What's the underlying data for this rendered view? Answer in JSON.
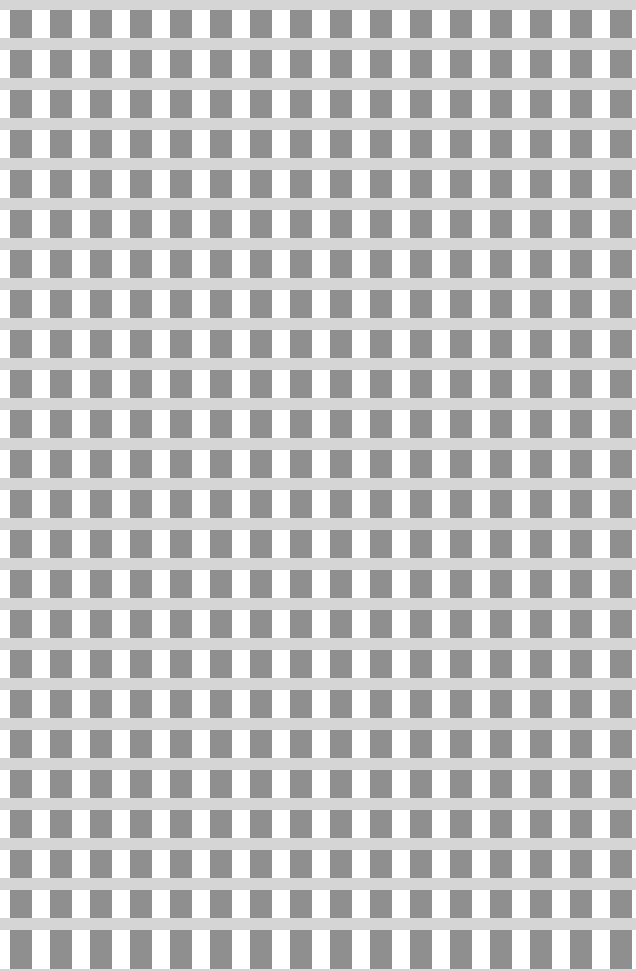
{
  "image": {
    "kind": "gingham-checkered-pattern",
    "width": 636,
    "height": 971,
    "background_color": "#ffffff"
  },
  "pattern": {
    "name": "gingham",
    "description": "Repeating gingham / checkered grid of medium-gray squares on a white field, overlaid by uniform light-gray horizontal bands.",
    "tile_width": 40,
    "tile_height": 40,
    "square_color": "#8f8f8f",
    "band_color": "#d5d5d5",
    "field_color": "#ffffff",
    "square_width": 22,
    "square_height": 28,
    "square_offset_x": 10,
    "band_height": 12,
    "phase_offset_y": -30,
    "band_over_columns": true,
    "columns_visible": 16,
    "rows_visible": 25
  },
  "colors": {
    "square": "#8f8f8f",
    "band": "#d5d5d5",
    "field": "#ffffff"
  }
}
